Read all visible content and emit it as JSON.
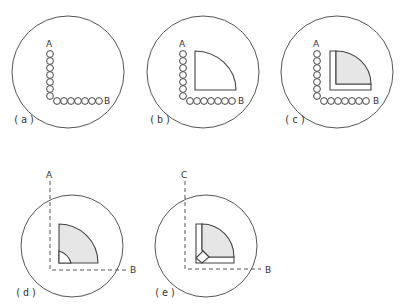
{
  "figure": {
    "panels": [
      {
        "id": "a",
        "caption": "(a)",
        "label_top": "A",
        "label_right": "B",
        "content": "bead-chain-L"
      },
      {
        "id": "b",
        "caption": "(b)",
        "label_top": "A",
        "label_right": "B",
        "content": "bead-chain-L with quarter-round insert"
      },
      {
        "id": "c",
        "caption": "(c)",
        "label_top": "A",
        "label_right": "B",
        "content": "bead-chain-L with L-frame and shaded quarter-round"
      },
      {
        "id": "d",
        "caption": "(d)",
        "label_top": "A",
        "label_right": "B",
        "content": "dashed axes with shaded quarter-round, chamfered corner"
      },
      {
        "id": "e",
        "caption": "(e)",
        "label_top": "C",
        "label_right": "B",
        "content": "dashed axes with L-frame, chamfered corner, shaded quarter-round"
      }
    ],
    "colors": {
      "stroke": "#444444",
      "shade": "#e6e6e6",
      "background": "#ffffff"
    }
  }
}
